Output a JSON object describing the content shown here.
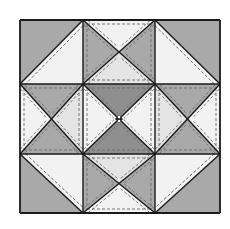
{
  "figure": {
    "grid": {
      "rows": 3,
      "cols": 3
    },
    "colors": {
      "background": "#ffffff",
      "dark": "#a9a9a9",
      "medium": "#c6c6c6",
      "light": "#e4e4e4",
      "very_light": "#f2f2f2",
      "center_dark": "#8f8f8f",
      "outline": "#1a1a1a",
      "stitch": "#6a6a6a"
    },
    "units": [
      {
        "position": "top-left",
        "type": "half-square-triangle",
        "outer": "dark",
        "inner": "very_light"
      },
      {
        "position": "top-center",
        "type": "hourglass",
        "top": "very_light",
        "left": "dark",
        "right": "dark",
        "bottom": "light"
      },
      {
        "position": "top-right",
        "type": "half-square-triangle",
        "outer": "dark",
        "inner": "very_light"
      },
      {
        "position": "middle-left",
        "type": "hourglass",
        "top": "dark",
        "bottom": "dark",
        "left": "very_light",
        "right": "light"
      },
      {
        "position": "center",
        "type": "hourglass",
        "top": "center_dark",
        "bottom": "center_dark",
        "left": "very_light",
        "right": "very_light"
      },
      {
        "position": "middle-right",
        "type": "hourglass",
        "top": "dark",
        "bottom": "dark",
        "left": "light",
        "right": "very_light"
      },
      {
        "position": "bottom-left",
        "type": "half-square-triangle",
        "outer": "dark",
        "inner": "very_light"
      },
      {
        "position": "bottom-center",
        "type": "hourglass",
        "top": "light",
        "left": "dark",
        "right": "dark",
        "bottom": "very_light"
      },
      {
        "position": "bottom-right",
        "type": "half-square-triangle",
        "outer": "dark",
        "inner": "very_light"
      }
    ]
  }
}
